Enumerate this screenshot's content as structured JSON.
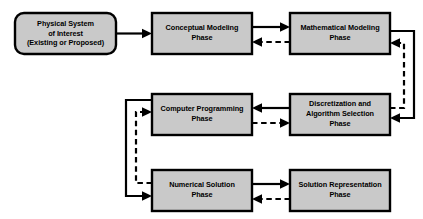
{
  "diagram": {
    "background_color": "#ffffff",
    "box_fill_color": "#c9c9c9",
    "box_border_color": "#000000",
    "connector_color": "#000000",
    "nodes": [
      {
        "id": "physical-system",
        "shape": "rounded-rectangle",
        "line1": "Physical System",
        "line2": "of Interest",
        "line3": "(Existing or Proposed)"
      },
      {
        "id": "conceptual-modeling",
        "shape": "rectangle",
        "line1": "Conceptual Modeling",
        "line2": "Phase",
        "line3": ""
      },
      {
        "id": "mathematical-modeling",
        "shape": "rectangle",
        "line1": "Mathematical Modeling",
        "line2": "Phase",
        "line3": ""
      },
      {
        "id": "computer-programming",
        "shape": "rectangle",
        "line1": "Computer Programming",
        "line2": "Phase",
        "line3": ""
      },
      {
        "id": "discretization-algorithm",
        "shape": "rectangle",
        "line1": "Discretization and",
        "line2": "Algorithm Selection",
        "line3": "Phase"
      },
      {
        "id": "numerical-solution",
        "shape": "rectangle",
        "line1": "Numerical Solution",
        "line2": "Phase",
        "line3": ""
      },
      {
        "id": "solution-representation",
        "shape": "rectangle",
        "line1": "Solution Representation",
        "line2": "Phase",
        "line3": ""
      }
    ],
    "connectors": [
      {
        "id": "physical-to-conceptual",
        "style": "solid",
        "direction": "right"
      },
      {
        "id": "conceptual-to-mathematical",
        "style": "solid",
        "direction": "right"
      },
      {
        "id": "mathematical-to-conceptual",
        "style": "dashed",
        "direction": "left"
      },
      {
        "id": "mathematical-to-discretization",
        "style": "solid",
        "direction": "down-loop-right"
      },
      {
        "id": "discretization-to-mathematical",
        "style": "dashed",
        "direction": "up-loop-right"
      },
      {
        "id": "discretization-to-computer",
        "style": "solid",
        "direction": "left"
      },
      {
        "id": "computer-to-discretization",
        "style": "dashed",
        "direction": "right"
      },
      {
        "id": "computer-to-numerical",
        "style": "solid",
        "direction": "down-loop-left"
      },
      {
        "id": "numerical-to-computer",
        "style": "dashed",
        "direction": "up-loop-left"
      },
      {
        "id": "numerical-to-solution-representation",
        "style": "solid",
        "direction": "right"
      },
      {
        "id": "solution-representation-to-numerical",
        "style": "dashed",
        "direction": "left"
      }
    ]
  }
}
